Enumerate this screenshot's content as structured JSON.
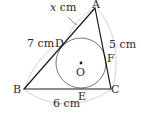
{
  "diagram": {
    "type": "geometry-incircle-triangle",
    "points": {
      "A": {
        "label": "A",
        "x": 95,
        "y": 8
      },
      "B": {
        "label": "B",
        "x": 24,
        "y": 89
      },
      "C": {
        "label": "C",
        "x": 111,
        "y": 89
      },
      "D": {
        "label": "D",
        "x": 66,
        "y": 42
      },
      "E": {
        "label": "E",
        "x": 82,
        "y": 89
      },
      "F": {
        "label": "F",
        "x": 106,
        "y": 55
      },
      "O": {
        "label": "O",
        "x": 81,
        "y": 63
      }
    },
    "incircle": {
      "center": "O",
      "radius": 25
    },
    "measurements": {
      "AD": "x cm",
      "BD": "7 cm",
      "AC": "5 cm",
      "BC": "6 cm"
    },
    "labels": {
      "x_var": "x",
      "x_unit": " cm",
      "bd": "7 cm",
      "ac": "5 cm",
      "bc": "6 cm"
    },
    "colors": {
      "line": "#1a1a1a",
      "circle": "#555555",
      "arc": "#c8c8c8",
      "text": "#2a2a2a"
    }
  }
}
